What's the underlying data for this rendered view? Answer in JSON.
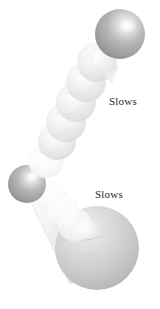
{
  "figure": {
    "domain_kind": "scientific-illustration",
    "background_color": "#ffffff",
    "width": 160,
    "height": 309,
    "description_title": "",
    "annotations": [
      {
        "id": "slows-upper",
        "text": "Slows",
        "x": 109,
        "y": 95,
        "color": "#2b2b2b"
      },
      {
        "id": "slows-lower",
        "text": "Slows",
        "x": 95,
        "y": 188,
        "color": "#2b2b2b"
      }
    ],
    "palette": {
      "sphere_dark": "#9a9a9a",
      "sphere_dark_mid": "#b4b4b4",
      "sphere_light": "#e3e3e3",
      "sphere_pale": "#f2f2f2",
      "bulb_fill": "#d6d6d6",
      "bulb_mid": "#c2c2c2",
      "highlight": "#ffffff",
      "outline": "#bfbfbf",
      "text": "#2b2b2b"
    },
    "shapes": {
      "top_sphere": {
        "name": "top-terminal-sphere",
        "cx": 120,
        "cy": 34,
        "r": 25,
        "tone": "dark"
      },
      "elbow_sphere": {
        "name": "elbow-sphere",
        "cx": 27,
        "cy": 184,
        "r": 19,
        "tone": "dark"
      },
      "bottom_bulb": {
        "name": "bottom-bulb",
        "cx": 97,
        "cy": 248,
        "r": 42,
        "tone": "mid"
      },
      "chain_upper": {
        "name": "upper-sphere-chain",
        "count": 6,
        "from": [
          104,
          57
        ],
        "to": [
          47,
          157
        ],
        "radius": 20
      },
      "chain_lower": {
        "name": "lower-tapered-neck",
        "from": [
          40,
          190
        ],
        "to": [
          92,
          246
        ],
        "segments": 5
      }
    }
  }
}
